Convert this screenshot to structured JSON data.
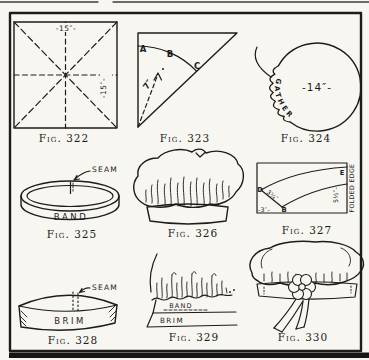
{
  "palette": {
    "paper": "#f8f6f1",
    "ink": "#1c1c1c"
  },
  "figures": [
    {
      "caption": "Fig. 322",
      "labels": {
        "width": "-15″-",
        "height": "-15″-"
      }
    },
    {
      "caption": "Fig. 323",
      "labels": {
        "a": "A",
        "b": "B",
        "c": "C",
        "radius": "7″"
      }
    },
    {
      "caption": "Fig. 324",
      "labels": {
        "diameter": "-14″-",
        "gather": "GATHER"
      }
    },
    {
      "caption": "Fig. 325",
      "labels": {
        "seam": "SEAM",
        "band": "BAND"
      }
    },
    {
      "caption": "Fig. 326",
      "labels": {}
    },
    {
      "caption": "Fig. 327",
      "labels": {
        "d": "D",
        "b": "B",
        "e": "E",
        "width": "-3″-",
        "end": "3¼″",
        "length": "5½″-",
        "fold": "FOLDED EDGE"
      }
    },
    {
      "caption": "Fig. 328",
      "labels": {
        "seam": "SEAM",
        "brim": "BRIM"
      }
    },
    {
      "caption": "Fig. 329",
      "labels": {
        "band": "BAND",
        "brim": "BRIM"
      }
    },
    {
      "caption": "Fig. 330",
      "labels": {}
    }
  ]
}
